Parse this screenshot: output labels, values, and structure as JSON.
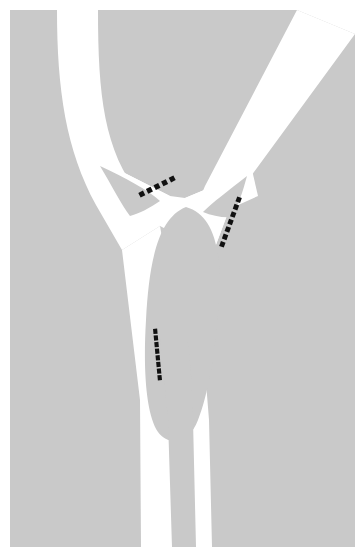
{
  "figure": {
    "type": "road-network-diagram",
    "canvas": {
      "width": 364,
      "height": 559
    },
    "colors": {
      "page_background": "#ffffff",
      "land_background": "#c9c9c9",
      "island_fill": "#c9c9c9",
      "roadway_fill": "#ffffff",
      "stop_line": "#111111"
    },
    "margins": {
      "left": 10,
      "top": 10,
      "right": 9,
      "bottom": 12
    }
  },
  "geometry": {
    "land_area": {
      "name": "land-background",
      "description": "Grey background area with a diagonal bevel at the top right corner",
      "path": "M 10 10 L 297 10 L 355 34 L 355 547 L 10 547 Z"
    },
    "roads": [
      {
        "id": "road-main-north",
        "name": "main-road-north-leg",
        "description": "Main carriageway entering from the top left, curving south-east toward the junction",
        "path": "M 57 10 L 98 10 C 98 96 104 150 140 196 L 160 226 L 122 250 L 96 205 C 66 150 57 90 57 10 Z"
      },
      {
        "id": "road-branch-northeast",
        "name": "branch-road-northeast-leg",
        "description": "Secondary carriageway entering from the top right corner diagonally",
        "path": "M 297 10 L 355 34 L 232 202 L 211 258 L 183 238 L 205 186 Z"
      },
      {
        "id": "road-south-west-leg",
        "name": "south-west-outbound-leg",
        "description": "Left outbound carriageway running from the junction down to the bottom edge",
        "path": "M 122 250 L 160 226 L 173 300 L 176 400 L 177 547 L 141 547 L 140 400 Z"
      },
      {
        "id": "road-south-east-leg",
        "name": "south-east-outbound-leg",
        "description": "Right outbound carriageway running from the junction down to the bottom edge",
        "path": "M 211 258 L 183 238 L 201 320 L 209 420 L 212 547 L 186 547 L 185 420 Z"
      },
      {
        "id": "road-west-crossbar",
        "name": "west-crossbar-link",
        "description": "Short linking carriageway across the top of the left triangular island",
        "path": "M 99 160 L 170 196 L 160 226 L 96 190 Z"
      },
      {
        "id": "road-east-crossbar",
        "name": "east-crossbar-link",
        "description": "Short linking carriageway across the top of the right triangular island",
        "path": "M 185 198 L 252 170 L 258 196 L 196 224 Z"
      }
    ],
    "islands": [
      {
        "id": "island-central",
        "name": "central-teardrop-island",
        "description": "Large teardrop / pear shaped central traffic island",
        "path": "M 186 207 C 214 215 222 250 219 300 C 216 350 208 395 198 420 C 190 442 170 448 158 432 C 146 414 143 370 146 320 C 149 262 158 218 186 207 Z"
      },
      {
        "id": "island-left",
        "name": "left-triangular-island",
        "description": "Small curved triangular island on the west side of the junction",
        "path": "M 100 166 C 126 178 148 190 160 201 C 150 208 138 214 130 216 C 122 206 112 186 100 166 Z"
      },
      {
        "id": "island-right",
        "name": "right-triangular-island",
        "description": "Small curved triangular island on the east side of the junction",
        "path": "M 247 176 C 229 190 212 203 203 212 C 212 216 224 218 232 217 C 238 206 243 191 247 176 Z"
      },
      {
        "id": "island-median-south",
        "name": "south-median-strip",
        "description": "Narrow grey median dividing the two southbound carriageways",
        "path": "M 160 335 L 186 335 C 190 352 192 380 193 420 L 196 547 L 172 547 L 168 420 C 165 385 162 358 160 335 Z"
      }
    ],
    "stop_lines": [
      {
        "id": "stop-line-northwest",
        "name": "stop-line-northwest-approach",
        "description": "Dashed stop / give-way line on the north-west approach, running up to the right",
        "from": [
          138,
          196
        ],
        "to": [
          176,
          177
        ],
        "dash_count": 5,
        "angle_deg": -27
      },
      {
        "id": "stop-line-northeast",
        "name": "stop-line-northeast-approach",
        "description": "Dashed stop / give-way line on the north-east approach, running down to the left",
        "from": [
          240,
          196
        ],
        "to": [
          221,
          248
        ],
        "dash_count": 7,
        "angle_deg": 70
      },
      {
        "id": "stop-line-south",
        "name": "stop-line-south-approach",
        "description": "Dashed stop / give-way line on the southern approach, running nearly vertically",
        "from": [
          155,
          328
        ],
        "to": [
          160,
          381
        ],
        "dash_count": 8,
        "angle_deg": 84
      }
    ]
  }
}
